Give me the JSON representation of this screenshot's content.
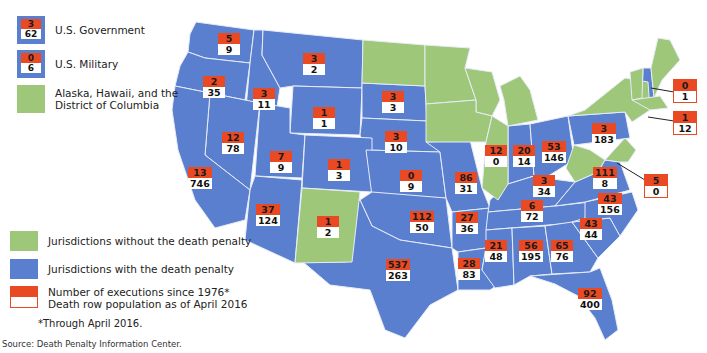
{
  "legend": {
    "us_government": {
      "label": "U.S. Government",
      "executions": "3",
      "death_row": "62"
    },
    "us_military": {
      "label": "U.S. Military",
      "executions": "0",
      "death_row": "6"
    },
    "ak_hi_dc": {
      "label": "Alaska, Hawaii, and the\nDistrict of Columbia"
    },
    "no_penalty": {
      "label": "Jurisdictions without the death penalty"
    },
    "with_penalty": {
      "label": "Jurisdictions with the death penalty"
    },
    "box_key": {
      "label": "Number of executions since 1976*\nDeath row population as of April 2016"
    },
    "footnote": "*Through April 2016.",
    "source": "Source: Death Penalty Information Center."
  },
  "colors": {
    "with_death_penalty": "#5b7fcf",
    "without_death_penalty": "#9ec77a",
    "executions": "#e94a24",
    "death_row": "#ffffff"
  },
  "states": [
    {
      "id": "WA",
      "executions": "5",
      "death_row": "9"
    },
    {
      "id": "OR",
      "executions": "2",
      "death_row": "35"
    },
    {
      "id": "ID",
      "executions": "3",
      "death_row": "11"
    },
    {
      "id": "MT",
      "executions": "3",
      "death_row": "2"
    },
    {
      "id": "WY",
      "executions": "1",
      "death_row": "1"
    },
    {
      "id": "SD",
      "executions": "3",
      "death_row": "3"
    },
    {
      "id": "NE",
      "executions": "3",
      "death_row": "10"
    },
    {
      "id": "NV",
      "executions": "12",
      "death_row": "78"
    },
    {
      "id": "UT",
      "executions": "7",
      "death_row": "9"
    },
    {
      "id": "CO",
      "executions": "1",
      "death_row": "3"
    },
    {
      "id": "KS",
      "executions": "0",
      "death_row": "9"
    },
    {
      "id": "CA",
      "executions": "13",
      "death_row": "746"
    },
    {
      "id": "AZ",
      "executions": "37",
      "death_row": "124"
    },
    {
      "id": "NM",
      "executions": "1",
      "death_row": "2"
    },
    {
      "id": "OK",
      "executions": "112",
      "death_row": "50"
    },
    {
      "id": "TX",
      "executions": "537",
      "death_row": "263"
    },
    {
      "id": "MO",
      "executions": "86",
      "death_row": "31"
    },
    {
      "id": "AR",
      "executions": "27",
      "death_row": "36"
    },
    {
      "id": "LA",
      "executions": "28",
      "death_row": "83"
    },
    {
      "id": "IL",
      "executions": "12",
      "death_row": "0"
    },
    {
      "id": "IN",
      "executions": "20",
      "death_row": "14"
    },
    {
      "id": "OH",
      "executions": "53",
      "death_row": "146"
    },
    {
      "id": "KY",
      "executions": "3",
      "death_row": "34"
    },
    {
      "id": "TN",
      "executions": "6",
      "death_row": "72"
    },
    {
      "id": "MS",
      "executions": "21",
      "death_row": "48"
    },
    {
      "id": "AL",
      "executions": "56",
      "death_row": "195"
    },
    {
      "id": "GA",
      "executions": "65",
      "death_row": "76"
    },
    {
      "id": "FL",
      "executions": "92",
      "death_row": "400"
    },
    {
      "id": "SC",
      "executions": "43",
      "death_row": "44"
    },
    {
      "id": "NC",
      "executions": "43",
      "death_row": "156"
    },
    {
      "id": "VA",
      "executions": "111",
      "death_row": "8"
    },
    {
      "id": "PA",
      "executions": "3",
      "death_row": "183"
    },
    {
      "id": "NH",
      "executions": "0",
      "death_row": "1"
    },
    {
      "id": "CT",
      "executions": "1",
      "death_row": "12"
    },
    {
      "id": "DE",
      "executions": "5",
      "death_row": "0"
    }
  ]
}
